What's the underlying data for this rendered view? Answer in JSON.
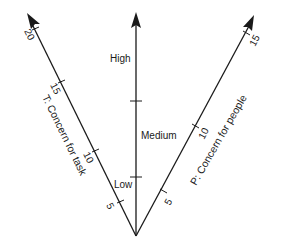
{
  "diagram": {
    "colors": {
      "line": "#1a1a1a",
      "background": "#ffffff"
    },
    "vertical_axis": {
      "levels": [
        "High",
        "Medium",
        "Low"
      ]
    },
    "left_axis": {
      "label": "T: Concern for task",
      "ticks": [
        "5",
        "10",
        "15",
        "20"
      ]
    },
    "right_axis": {
      "label": "P: Concern for people",
      "ticks": [
        "5",
        "10",
        "15"
      ]
    }
  }
}
